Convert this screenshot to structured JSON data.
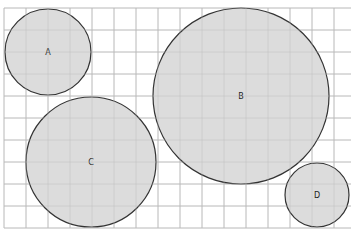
{
  "diagram": {
    "type": "circles-on-grid",
    "grid": {
      "spacing": 22,
      "origin_x": 4,
      "origin_y": 8,
      "cols": 16,
      "rows": 10,
      "line_color": "#bdbdbd"
    },
    "fill_color": "#dcdcdc",
    "stroke_color": "#333333",
    "circles": [
      {
        "label": "A",
        "cx": 48,
        "cy": 52,
        "r": 43
      },
      {
        "label": "B",
        "cx": 241,
        "cy": 96,
        "r": 88
      },
      {
        "label": "C",
        "cx": 91,
        "cy": 162,
        "r": 65
      },
      {
        "label": "D",
        "cx": 317,
        "cy": 195,
        "r": 32
      }
    ]
  }
}
